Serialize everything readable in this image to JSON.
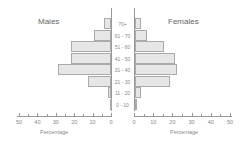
{
  "chart_data": {
    "type": "bar",
    "subtype": "population-pyramid",
    "title": "",
    "categories": [
      "70+",
      "61 - 70",
      "51 - 60",
      "41 - 50",
      "31 - 40",
      "21 - 30",
      "11 - 20",
      "0 - 10"
    ],
    "series": [
      {
        "name": "Males",
        "values": [
          4,
          9,
          22,
          22,
          29,
          12.5,
          1.5,
          0.5
        ]
      },
      {
        "name": "Females",
        "values": [
          3,
          6.5,
          15,
          21,
          22,
          18,
          3,
          1
        ]
      }
    ],
    "xlabel": "Percentage",
    "ylabel": "",
    "xlim": [
      0,
      50
    ],
    "x_ticks": [
      0,
      10,
      20,
      30,
      40,
      50
    ],
    "left_x_tick_labels": [
      "50",
      "40",
      "30",
      "20",
      "10",
      "0"
    ],
    "right_x_tick_labels": [
      "0",
      "10",
      "20",
      "30",
      "40",
      "50"
    ],
    "grid": false,
    "legend": "none (panel titles Males / Females)"
  },
  "labels": {
    "males": "Males",
    "females": "Females",
    "xlabel_left": "Percentage",
    "xlabel_right": "Percentage"
  },
  "colors": {
    "bar_fill": "#e6e6e6",
    "bar_border": "#aaaaaa",
    "axis": "#999999",
    "text": "#888888"
  }
}
